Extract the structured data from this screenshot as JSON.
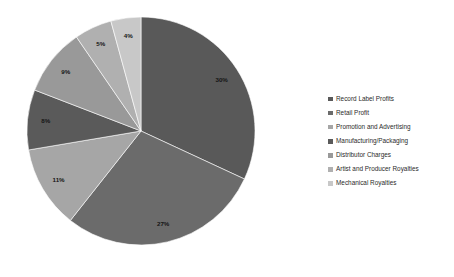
{
  "chart_data": {
    "type": "pie",
    "title": "",
    "labels": [
      "Record Label Profits",
      "Retail Profit",
      "Promotion and Advertising",
      "Manufacturing/Packaging",
      "Distributor Charges",
      "Artist and Producer Royalties",
      "Mechanical Royalties"
    ],
    "values": [
      30,
      27,
      11,
      8,
      9,
      5,
      4
    ],
    "value_labels": [
      "30%",
      "27%",
      "11%",
      "8%",
      "9%",
      "5%",
      "4%"
    ],
    "colors": [
      "#595959",
      "#6b6b6b",
      "#a6a6a6",
      "#5a5a5a",
      "#999999",
      "#b0b0b0",
      "#c8c8c8"
    ],
    "start_angle_deg": 0,
    "direction": "clockwise",
    "legend_position": "right",
    "grid": false,
    "background": "#ffffff"
  },
  "legend": {
    "items": [
      {
        "label": "Record Label Profits",
        "color": "#595959"
      },
      {
        "label": "Retail Profit",
        "color": "#6b6b6b"
      },
      {
        "label": "Promotion and Advertising",
        "color": "#a6a6a6"
      },
      {
        "label": "Manufacturing/Packaging",
        "color": "#5a5a5a"
      },
      {
        "label": "Distributor Charges",
        "color": "#999999"
      },
      {
        "label": "Artist and Producer Royalties",
        "color": "#b0b0b0"
      },
      {
        "label": "Mechanical Royalties",
        "color": "#c8c8c8"
      }
    ]
  }
}
